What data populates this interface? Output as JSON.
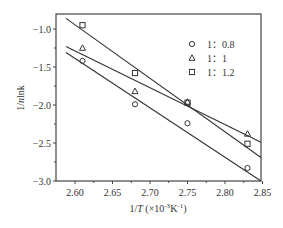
{
  "chart_data": {
    "type": "scatter",
    "title": "",
    "xlabel": "1/T (×10⁻³K⁻¹)",
    "xlabel_parts": {
      "prefix": "1/",
      "italic": "T",
      "suffix": " (×10",
      "sup1": "-3",
      "mid": "K",
      "sup2": "-1",
      "end": ")"
    },
    "ylabel": "1/nlnk",
    "ylabel_parts": {
      "prefix": "1/",
      "italic": "n",
      "suffix": "lnk"
    },
    "xlim": [
      2.575,
      2.85
    ],
    "ylim": [
      -3.0,
      -0.8
    ],
    "xticks": [
      2.6,
      2.65,
      2.7,
      2.75,
      2.8,
      2.85
    ],
    "xtick_labels": [
      "2.60",
      "2.65",
      "2.70",
      "2.75",
      "2.80",
      "2.85"
    ],
    "yticks": [
      -1.0,
      -1.5,
      -2.0,
      -2.5,
      -3.0
    ],
    "ytick_labels": [
      "-1.0",
      "-1.5",
      "-2.0",
      "-2.5",
      "-3.0"
    ],
    "grid": false,
    "legend_position": "upper right",
    "series": [
      {
        "name": "1：0.8",
        "marker": "circle",
        "x": [
          2.61,
          2.68,
          2.75,
          2.83
        ],
        "y": [
          -1.42,
          -1.99,
          -2.24,
          -2.83
        ],
        "fit_line": {
          "x": [
            2.588,
            2.848
          ],
          "y": [
            -1.31,
            -3.0
          ]
        }
      },
      {
        "name": "1：1",
        "marker": "triangle",
        "x": [
          2.61,
          2.68,
          2.75,
          2.83
        ],
        "y": [
          -1.25,
          -1.82,
          -1.96,
          -2.38
        ],
        "fit_line": {
          "x": [
            2.588,
            2.848
          ],
          "y": [
            -1.23,
            -2.49
          ]
        }
      },
      {
        "name": "1：1.2",
        "marker": "square",
        "x": [
          2.61,
          2.68,
          2.75,
          2.83
        ],
        "y": [
          -0.95,
          -1.58,
          -1.97,
          -2.51
        ],
        "fit_line": {
          "x": [
            2.588,
            2.848
          ],
          "y": [
            -0.86,
            -2.69
          ]
        }
      }
    ]
  }
}
